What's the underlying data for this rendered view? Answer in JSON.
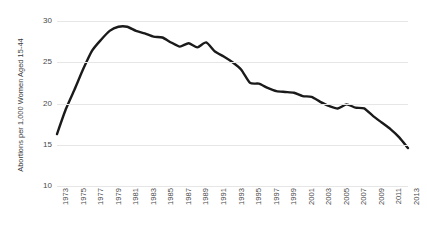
{
  "chart_data": {
    "type": "line",
    "title": "",
    "xlabel": "",
    "ylabel": "Abortions per 1,000 Women Aged 15-44",
    "ylim": [
      10,
      30
    ],
    "xlim": [
      1973,
      2013
    ],
    "yticks": [
      10,
      15,
      20,
      25,
      30
    ],
    "ytick_labels": [
      "10",
      "15",
      "20",
      "25",
      "30"
    ],
    "xticks": [
      1973,
      1975,
      1977,
      1979,
      1981,
      1983,
      1985,
      1987,
      1989,
      1991,
      1993,
      1995,
      1997,
      1999,
      2001,
      2003,
      2005,
      2007,
      2009,
      2011,
      2013
    ],
    "xtick_labels": [
      "1973",
      "1975",
      "1977",
      "1979",
      "1981",
      "1983",
      "1985",
      "1987",
      "1989",
      "1991",
      "1993",
      "1995",
      "1997",
      "1999",
      "2001",
      "2003",
      "2005",
      "2007",
      "2009",
      "2011",
      "2013"
    ],
    "grid": true,
    "legend": false,
    "legend_position": "none",
    "line_color": "#1a1a1a",
    "grid_color": "#e6e6e6",
    "background_color": "#ffffff",
    "x": [
      1973,
      1974,
      1975,
      1976,
      1977,
      1978,
      1979,
      1980,
      1981,
      1982,
      1983,
      1984,
      1985,
      1986,
      1987,
      1988,
      1989,
      1990,
      1991,
      1992,
      1993,
      1994,
      1995,
      1996,
      1997,
      1998,
      1999,
      2000,
      2001,
      2002,
      2003,
      2004,
      2005,
      2006,
      2007,
      2008,
      2009,
      2010,
      2011,
      2012,
      2013
    ],
    "series": [
      {
        "name": "Abortion rate",
        "values": [
          16.3,
          19.3,
          21.7,
          24.2,
          26.4,
          27.7,
          28.8,
          29.3,
          29.3,
          28.8,
          28.5,
          28.1,
          28.0,
          27.4,
          26.9,
          27.3,
          26.8,
          27.4,
          26.3,
          25.7,
          25.0,
          24.1,
          22.5,
          22.4,
          21.9,
          21.5,
          21.4,
          21.3,
          20.9,
          20.8,
          20.2,
          19.7,
          19.4,
          19.9,
          19.5,
          19.4,
          18.5,
          17.7,
          16.9,
          15.9,
          14.6
        ]
      }
    ]
  }
}
